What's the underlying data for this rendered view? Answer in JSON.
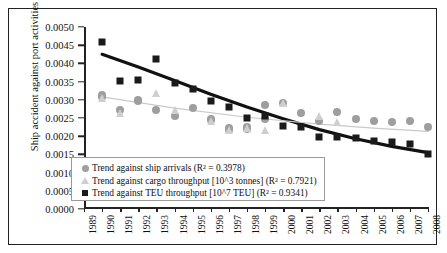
{
  "chart_data": {
    "type": "scatter",
    "title": "",
    "xlabel": "",
    "ylabel": "Ship accident against port activities",
    "ylim": [
      0.0,
      0.005
    ],
    "xlim": [
      1989,
      2008
    ],
    "grid": false,
    "legend_position": "lower-left-inside",
    "yticks": [
      "0.0000",
      "0.0005",
      "0.0010",
      "0.0015",
      "0.0020",
      "0.0025",
      "0.0030",
      "0.0035",
      "0.0040",
      "0.0045",
      "0.0050"
    ],
    "ytick_values": [
      0.0,
      0.0005,
      0.001,
      0.0015,
      0.002,
      0.0025,
      0.003,
      0.0035,
      0.004,
      0.0045,
      0.005
    ],
    "categories": [
      "1989",
      "1990",
      "1991",
      "1992",
      "1993",
      "1994",
      "1995",
      "1996",
      "1997",
      "1998",
      "1999",
      "2000",
      "2001",
      "2002",
      "2003",
      "2004",
      "2005",
      "2006",
      "2007",
      "2008"
    ],
    "series": [
      {
        "name": "Trend against ship arrivals (R² = 0.3978)",
        "marker": "circle",
        "color": "#9e9e9e",
        "r_squared": 0.3978,
        "x": [
          1990,
          1990,
          1991,
          1992,
          1992,
          1993,
          1994,
          1995,
          1996,
          1996,
          1997,
          1997,
          1998,
          1998,
          1999,
          1999,
          2000,
          2001,
          2002,
          2003,
          2004,
          2005,
          2006,
          2007,
          2008
        ],
        "values": [
          0.00313,
          0.00307,
          0.00273,
          0.003,
          0.00297,
          0.00272,
          0.00255,
          0.00278,
          0.00247,
          0.00244,
          0.00222,
          0.00218,
          0.00225,
          0.00221,
          0.00248,
          0.00285,
          0.00292,
          0.00263,
          0.00242,
          0.00267,
          0.00248,
          0.00242,
          0.0024,
          0.00243,
          0.00225
        ]
      },
      {
        "name": "Trend against cargo throughput [10^3 tonnes] (R² = 0.7921)",
        "marker": "triangle",
        "color": "#cfcfcf",
        "r_squared": 0.7921,
        "x": [
          1990,
          1991,
          1993,
          1994,
          1996,
          1997,
          1998,
          1999,
          2000,
          2002,
          2003
        ],
        "values": [
          0.00305,
          0.00263,
          0.0032,
          0.00272,
          0.00243,
          0.00218,
          0.00223,
          0.00218,
          0.0029,
          0.00255,
          0.0024
        ]
      },
      {
        "name": "Trend against TEU throughput [10^7 TEU] (R² = 0.9341)",
        "marker": "square",
        "color": "#1a1a1a",
        "r_squared": 0.9341,
        "x": [
          1990,
          1991,
          1992,
          1993,
          1994,
          1995,
          1996,
          1997,
          1998,
          1999,
          2000,
          2001,
          2002,
          2003,
          2004,
          2005,
          2006,
          2007,
          2008
        ],
        "values": [
          0.00458,
          0.00351,
          0.00354,
          0.00413,
          0.00345,
          0.00329,
          0.00296,
          0.00281,
          0.0025,
          0.00256,
          0.00228,
          0.00224,
          0.00197,
          0.00198,
          0.00195,
          0.00188,
          0.00183,
          0.00178,
          0.00152
        ]
      }
    ],
    "trendlines": [
      {
        "name": "TEU throughput trend",
        "color": "#111111",
        "width": 3.2,
        "points": [
          [
            1990,
            0.00425
          ],
          [
            1992,
            0.0039
          ],
          [
            1994,
            0.00353
          ],
          [
            1996,
            0.00315
          ],
          [
            1998,
            0.0028
          ],
          [
            2000,
            0.00248
          ],
          [
            2002,
            0.00218
          ],
          [
            2004,
            0.00193
          ],
          [
            2006,
            0.00172
          ],
          [
            2008,
            0.00155
          ]
        ]
      },
      {
        "name": "Ship arrivals trend",
        "color": "#c9c9c9",
        "width": 1.2,
        "points": [
          [
            1990,
            0.00308
          ],
          [
            1994,
            0.00277
          ],
          [
            1998,
            0.00252
          ],
          [
            2002,
            0.00233
          ],
          [
            2005,
            0.00222
          ],
          [
            2008,
            0.00213
          ]
        ]
      }
    ],
    "legend_entries": [
      {
        "marker": "circle",
        "label": "Trend against ship arrivals (R² = 0.3978)"
      },
      {
        "marker": "triangle",
        "label": "Trend against cargo throughput [10^3 tonnes] (R² = 0.7921)"
      },
      {
        "marker": "square",
        "label": "Trend against TEU throughput [10^7 TEU] (R² = 0.9341)"
      }
    ]
  }
}
